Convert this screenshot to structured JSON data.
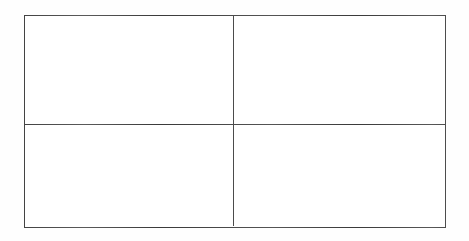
{
  "document": {
    "type": "scanned-table",
    "description": "Empty two-column by two-row table grid",
    "background_color": "#ffffff",
    "page_tone": "#fefefe"
  },
  "table": {
    "name": "empty-grid",
    "rows": 2,
    "columns": 2,
    "border_color": "#3a3a3a",
    "border_width_px": 1.5,
    "cell_background": "#ffffff",
    "bounds": {
      "left": 24,
      "top": 15,
      "width": 422,
      "height": 213
    },
    "dividers": {
      "vertical_x": 234,
      "horizontal_y": 124
    },
    "column_headers": [
      "",
      ""
    ],
    "cells": [
      [
        {
          "id": "r1c1",
          "text": ""
        },
        {
          "id": "r1c2",
          "text": ""
        }
      ],
      [
        {
          "id": "r2c1",
          "text": ""
        },
        {
          "id": "r2c2",
          "text": ""
        }
      ]
    ]
  }
}
